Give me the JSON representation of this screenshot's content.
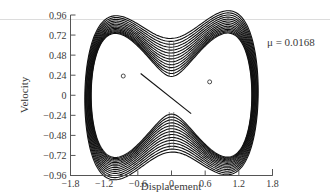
{
  "chart_data": {
    "type": "line",
    "title": "",
    "xlabel": "Displacement",
    "ylabel": "Velocity",
    "annotation": "μ = 0.0168",
    "xlim": [
      -1.8,
      1.8
    ],
    "ylim": [
      -0.96,
      0.96
    ],
    "xticks": [
      -1.8,
      -1.2,
      -0.6,
      0,
      0.6,
      1.2,
      1.8
    ],
    "xtick_labels": [
      "−1.8",
      "−1.2",
      "−0.6",
      "0",
      "0.6",
      "1.2",
      "1.8"
    ],
    "yticks": [
      0.96,
      0.72,
      0.48,
      0.24,
      0,
      -0.24,
      -0.48,
      -0.72,
      -0.96
    ],
    "ytick_labels": [
      "0.96",
      "0.72",
      "0.48",
      "0.24",
      "0",
      "−0.24",
      "−0.48",
      "−0.72",
      "−0.96"
    ],
    "grid": false,
    "series": [
      {
        "name": "trajectory loops",
        "center_velocity_levels": [
          0.68,
          0.645,
          0.61,
          0.575,
          0.54,
          0.505,
          0.47,
          0.435,
          0.4,
          0.365,
          0.33,
          0.295,
          0.26,
          0.225
        ]
      },
      {
        "name": "equilibrium points",
        "points": [
          [
            -0.86,
            0.23
          ],
          [
            0.68,
            0.16
          ]
        ]
      }
    ]
  }
}
